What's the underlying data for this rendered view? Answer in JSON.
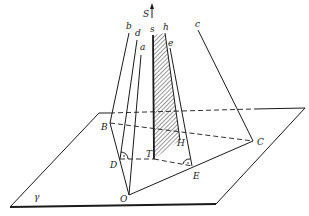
{
  "figure": {
    "plane_label": "γ",
    "axis_label": "S",
    "points": {
      "O": "O",
      "B": "B",
      "C": "C",
      "D": "D",
      "E": "E",
      "T": "T",
      "H": "H"
    },
    "lines": {
      "a": "a",
      "b": "b",
      "c": "c",
      "d": "d",
      "e": "e",
      "s": "s",
      "h": "h"
    },
    "caption": "Fig. ..."
  },
  "colors": {
    "ink": "#1a1a1a",
    "paper": "#ffffff"
  }
}
